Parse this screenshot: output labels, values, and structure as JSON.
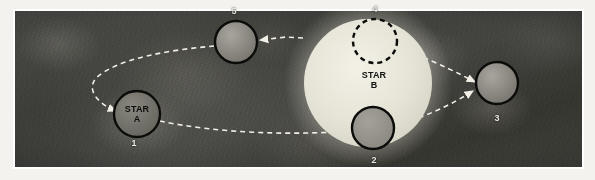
{
  "figure": {
    "background_color": "#3c3c38",
    "panel_border_color": "#ffffff"
  },
  "stars": [
    {
      "id": "star-a",
      "label_line1": "STAR",
      "label_line2": "A",
      "number_label": "1",
      "cx": 137,
      "cy": 114,
      "r": 23,
      "fill": "#6e6d66",
      "stroke": "#0b0b0a",
      "stroke_width": 2.4,
      "dashed": false,
      "label_x": 137,
      "label_y": 112,
      "number_x": 134,
      "number_y": 143
    },
    {
      "id": "star-b",
      "label_line1": "STAR",
      "label_line2": "B",
      "number_label": "",
      "cx": 368,
      "cy": 83,
      "r": 64,
      "fill": "#e7e5d9",
      "stroke": "none",
      "stroke_width": 0,
      "dashed": false,
      "label_x": 374,
      "label_y": 80,
      "number_x": 0,
      "number_y": 0
    }
  ],
  "bodies": [
    {
      "id": "body-2",
      "number_label": "2",
      "cx": 373,
      "cy": 128,
      "r": 21,
      "fill": "#93918a",
      "stroke": "#0b0b0a",
      "stroke_width": 2.4,
      "dashed": false,
      "number_x": 374,
      "number_y": 160
    },
    {
      "id": "body-3",
      "number_label": "3",
      "cx": 497,
      "cy": 83,
      "r": 21,
      "fill": "#7c7a73",
      "stroke": "#0b0b0a",
      "stroke_width": 2.4,
      "dashed": false,
      "number_x": 497,
      "number_y": 118
    },
    {
      "id": "body-4",
      "number_label": "4",
      "cx": 375,
      "cy": 41,
      "r": 22,
      "fill": "#e7e5d9",
      "stroke": "#0b0b0a",
      "stroke_width": 2.4,
      "dashed": true,
      "number_x": 375,
      "number_y": 9
    },
    {
      "id": "body-5",
      "number_label": "5",
      "cx": 236,
      "cy": 42,
      "r": 21,
      "fill": "#7f7d76",
      "stroke": "#0b0b0a",
      "stroke_width": 2.4,
      "dashed": false,
      "number_x": 234,
      "number_y": 11
    }
  ],
  "orbit_paths": [
    {
      "id": "orbit-upper-left",
      "description": "dashed path from star B leftward past body 5, curving around star A",
      "points": "303,38 284,37 258,40",
      "stroke": "#f2f0e6",
      "dash": "5,4",
      "width": 1.6,
      "arrow": "left"
    },
    {
      "id": "orbit-left-loop",
      "description": "dashed curve from body 5 sweeping left and down to star A",
      "points": "215,45 180,50 148,56 120,63 101,73 94,85 98,98 108,106 115,110",
      "stroke": "#f2f0e6",
      "dash": "5,4",
      "width": 1.6,
      "arrow": "end"
    },
    {
      "id": "orbit-lower-right",
      "description": "dashed path from star A rightward along the bottom toward body 3",
      "points": "159,120 200,128 250,133 300,133 340,131 380,127 420,117 450,104 474,93",
      "stroke": "#f2f0e6",
      "dash": "5,4",
      "width": 1.6,
      "arrow": "end"
    },
    {
      "id": "orbit-upper-right",
      "description": "dashed straight path from upper right of star B down to body 3",
      "points": "418,56 445,68 474,82",
      "stroke": "#f2f0e6",
      "dash": "5,4",
      "width": 1.6,
      "arrow": "end"
    }
  ]
}
